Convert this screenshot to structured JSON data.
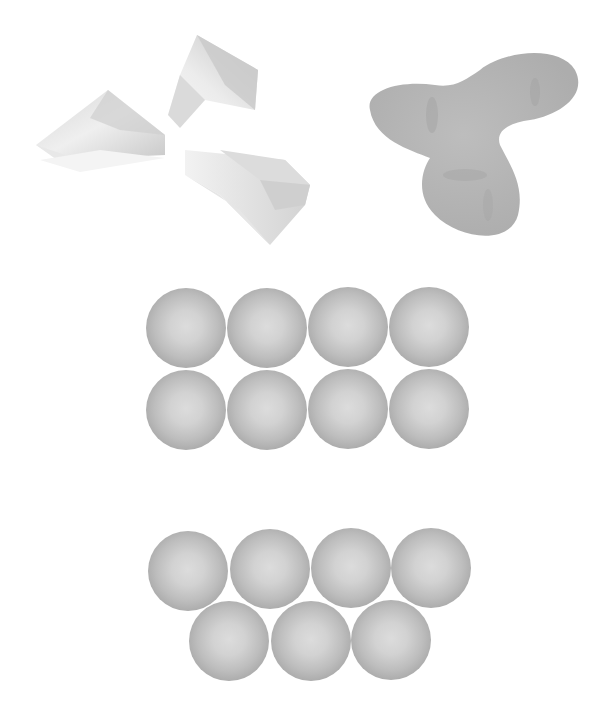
{
  "figure": {
    "panels": [
      {
        "id": "folded-sheets",
        "description": "Three folded triangular sheets (faceted paper-like shapes)",
        "shading": "light gray"
      },
      {
        "id": "trilobed-blob",
        "description": "Smooth three-lobed organic shape",
        "color": "#b8b8b8"
      },
      {
        "id": "square-packing",
        "description": "Spheres in a square grid arrangement",
        "rows": 2,
        "cols": 4,
        "count": 8
      },
      {
        "id": "hexagonal-packing",
        "description": "Spheres in a hexagonal/offset arrangement",
        "rows": [
          4,
          3
        ],
        "count": 7
      }
    ],
    "colors": {
      "background": "#ffffff",
      "sphere_center": "#dcdcdc",
      "sphere_edge": "#969696",
      "blob": "#b9b9b9",
      "sheet_light": "#f2f2f2",
      "sheet_dark": "#c8c8c8"
    },
    "square_grid": {
      "diameter": 80,
      "centers": [
        [
          186,
          328
        ],
        [
          267,
          328
        ],
        [
          348,
          327
        ],
        [
          429,
          327
        ],
        [
          186,
          410
        ],
        [
          267,
          410
        ],
        [
          348,
          409
        ],
        [
          429,
          409
        ]
      ]
    },
    "hex_grid": {
      "diameter": 80,
      "centers": [
        [
          188,
          571
        ],
        [
          270,
          569
        ],
        [
          351,
          568
        ],
        [
          431,
          568
        ],
        [
          229,
          641
        ],
        [
          311,
          641
        ],
        [
          391,
          640
        ]
      ]
    }
  }
}
